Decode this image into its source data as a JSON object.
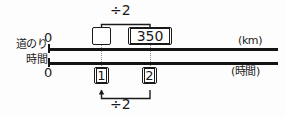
{
  "diagram": {
    "rows": {
      "distance": {
        "label": "道のり",
        "unit": "(km)",
        "origin": "0",
        "values": [
          {
            "id": "unknown",
            "text": "",
            "kind": "answer-box"
          },
          {
            "id": "known",
            "text": "350",
            "kind": "value-box"
          }
        ]
      },
      "time": {
        "label": "時間",
        "unit": "(時間)",
        "origin": "0",
        "values": [
          {
            "id": "one",
            "text": "1",
            "kind": "value-box"
          },
          {
            "id": "two",
            "text": "2",
            "kind": "value-box"
          }
        ]
      }
    },
    "operations": {
      "top": "÷2",
      "bottom": "÷2"
    }
  },
  "colors": {
    "line": "#141414",
    "ink": "#1a1a1a",
    "tick": "#8e8e8e",
    "background": "#fdfdfd"
  }
}
